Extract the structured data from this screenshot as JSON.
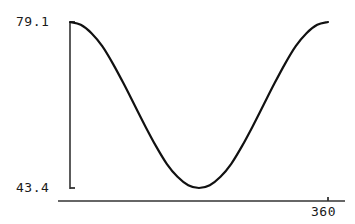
{
  "chart_data": {
    "type": "line",
    "title": "",
    "xlabel": "",
    "ylabel": "",
    "xlim": [
      0,
      360
    ],
    "ylim": [
      43.4,
      79.1
    ],
    "grid": false,
    "legend": null,
    "y_tick_labels": [
      "79.1",
      "43.4"
    ],
    "x_tick_labels": [
      "360"
    ],
    "y_ticks": [
      79.1,
      43.4
    ],
    "x_ticks": [
      360
    ],
    "series": [
      {
        "name": "cosine",
        "description": "One full cosine period: starts at maximum 79.1, falls to minimum 43.4 at x=180, returns to maximum 79.1 at x=360",
        "x": [
          0,
          15,
          30,
          45,
          60,
          75,
          90,
          105,
          120,
          135,
          150,
          165,
          180,
          195,
          210,
          225,
          240,
          255,
          270,
          285,
          300,
          315,
          330,
          345,
          360
        ],
        "values": [
          79.1,
          78.5,
          76.7,
          73.9,
          70.1,
          65.8,
          61.25,
          56.7,
          52.4,
          48.6,
          45.8,
          44.0,
          43.4,
          44.0,
          45.8,
          48.6,
          52.4,
          56.7,
          61.25,
          65.8,
          70.1,
          73.9,
          76.7,
          78.5,
          79.1
        ]
      }
    ]
  },
  "labels": {
    "y_max": "79.1",
    "y_min": "43.4",
    "x_max": "360"
  },
  "colors": {
    "background": "#ffffff",
    "curve": "#111111",
    "axis": "#333333",
    "text": "#1a1a1a"
  }
}
